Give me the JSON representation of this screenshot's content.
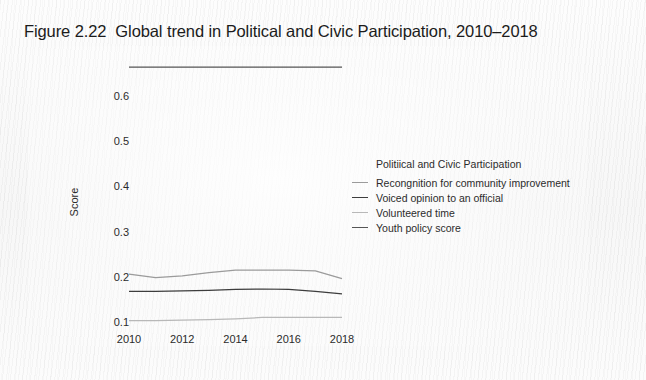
{
  "figure": {
    "title": "Figure 2.22  Global trend in Political and Civic Participation, 2010–2018"
  },
  "chart_data": {
    "type": "line",
    "title": "Figure 2.22  Global trend in Political and Civic Participation, 2010–2018",
    "xlabel": "",
    "ylabel": "Score",
    "x": [
      2010,
      2011,
      2012,
      2013,
      2014,
      2015,
      2016,
      2017,
      2018
    ],
    "xlim": [
      2010,
      2018
    ],
    "ylim": [
      0.085,
      0.68
    ],
    "xticks": [
      "2010",
      "2012",
      "2014",
      "2016",
      "2018"
    ],
    "xtick_values": [
      2010,
      2012,
      2014,
      2016,
      2018
    ],
    "yticks": [
      "0.1",
      "0.2",
      "0.3",
      "0.4",
      "0.5",
      "0.6"
    ],
    "ytick_values": [
      0.1,
      0.2,
      0.3,
      0.4,
      0.5,
      0.6
    ],
    "grid": false,
    "legend_position": "center-right",
    "legend_title": "Politiical and Civic Participation",
    "series": [
      {
        "name": "Recongnition for community improvement",
        "color": "#9b9b9b",
        "values": [
          0.206,
          0.198,
          0.202,
          0.209,
          0.215,
          0.215,
          0.215,
          0.213,
          0.196
        ]
      },
      {
        "name": "Voiced opinion to an official",
        "color": "#3d3d3d",
        "values": [
          0.168,
          0.168,
          0.169,
          0.17,
          0.172,
          0.173,
          0.172,
          0.168,
          0.162
        ]
      },
      {
        "name": "Volunteered time",
        "color": "#b8b8b8",
        "values": [
          0.103,
          0.103,
          0.104,
          0.105,
          0.107,
          0.11,
          0.11,
          0.11,
          0.11
        ]
      },
      {
        "name": "Youth policy score",
        "color": "#555555",
        "values": [
          0.664,
          0.664,
          0.664,
          0.664,
          0.664,
          0.664,
          0.664,
          0.664,
          0.664
        ]
      }
    ]
  },
  "legend": {
    "title": "Politiical and Civic Participation",
    "items": [
      {
        "label": "Recongnition for community improvement",
        "color": "#9b9b9b"
      },
      {
        "label": "Voiced opinion to an official",
        "color": "#3d3d3d"
      },
      {
        "label": "Volunteered time",
        "color": "#b8b8b8"
      },
      {
        "label": "Youth policy score",
        "color": "#555555"
      }
    ]
  },
  "axes": {
    "y_label": "Score",
    "y_ticks": [
      "0.6",
      "0.5",
      "0.4",
      "0.3",
      "0.2",
      "0.1"
    ],
    "x_ticks": [
      "2010",
      "2012",
      "2014",
      "2016",
      "2018"
    ]
  }
}
